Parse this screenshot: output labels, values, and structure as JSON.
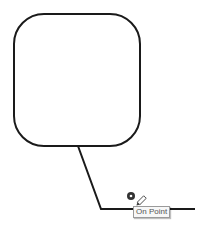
{
  "diagram": {
    "callout_shape": {
      "type": "rounded-rectangle",
      "stroke": "#1a1a1a"
    },
    "leader_line": {
      "stroke": "#1a1a1a"
    },
    "snap_indicator": {
      "icon": "snap-point-icon",
      "color": "#333333"
    },
    "cursor": {
      "icon": "pencil-icon"
    },
    "tooltip": {
      "text": "On Point"
    }
  }
}
